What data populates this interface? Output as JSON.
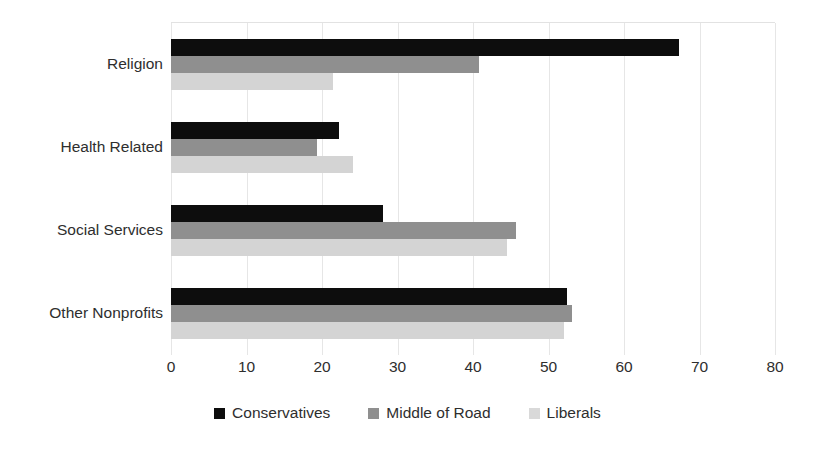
{
  "chart_data": {
    "type": "bar",
    "orientation": "horizontal",
    "title": "",
    "subtitle": "",
    "xlabel": "",
    "ylabel": "",
    "categories": [
      "Religion",
      "Health Related",
      "Social Services",
      "Other Nonprofits"
    ],
    "series": [
      {
        "name": "Conservatives",
        "color": "#0d0d0d",
        "values": [
          67.3,
          22.3,
          28.1,
          52.5
        ]
      },
      {
        "name": "Middle of Road",
        "color": "#8f8f8f",
        "values": [
          40.8,
          19.3,
          45.7,
          53.1
        ]
      },
      {
        "name": "Liberals",
        "color": "#d4d4d4",
        "values": [
          21.5,
          24.1,
          44.5,
          52.1
        ]
      }
    ],
    "xlim": [
      0,
      80
    ],
    "xticks": [
      0,
      10,
      20,
      30,
      40,
      50,
      60,
      70,
      80
    ],
    "xtick_labels": [
      "0",
      "10",
      "20",
      "30",
      "40",
      "50",
      "60",
      "70",
      "80"
    ],
    "grid": "vertical",
    "legend_position": "bottom"
  },
  "legend": {
    "items": [
      {
        "label": "Conservatives",
        "swatch": "legend-swatch-conservatives"
      },
      {
        "label": "Middle of Road",
        "swatch": "legend-swatch-middle-of-road"
      },
      {
        "label": "Liberals",
        "swatch": "legend-swatch-liberals"
      }
    ]
  }
}
